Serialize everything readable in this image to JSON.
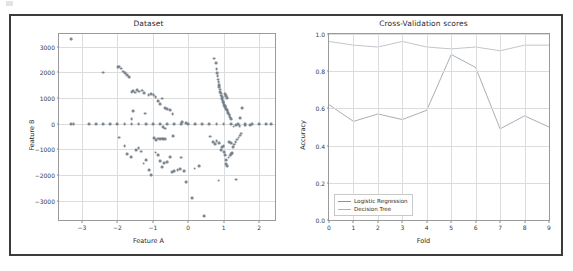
{
  "figure": {
    "background": "#ffffff",
    "border_color": "#3b3b3b"
  },
  "chart_data": [
    {
      "type": "scatter",
      "panel": "left",
      "title": "Dataset",
      "xlabel": "Feature A",
      "ylabel": "Feature B",
      "xlim": [
        -3.65,
        2.45
      ],
      "ylim": [
        -3750,
        3500
      ],
      "xticks": [
        -3,
        -2,
        -1,
        0,
        1,
        2
      ],
      "xticklabels": [
        "−3",
        "−2",
        "−1",
        "0",
        "1",
        "2"
      ],
      "yticks": [
        3000,
        2000,
        1000,
        0,
        -1000,
        -2000,
        -3000
      ],
      "yticklabels": [
        "3000",
        "2000",
        "1000",
        "0",
        "−1000",
        "−2000",
        "−3000"
      ],
      "grid": true,
      "marker_color": "#6f7b85",
      "points": [
        [
          -3.31,
          3290
        ],
        [
          -2.4,
          1995
        ],
        [
          -1.99,
          2215
        ],
        [
          -1.95,
          2230
        ],
        [
          -1.9,
          2150
        ],
        [
          -1.84,
          2035
        ],
        [
          -1.79,
          1985
        ],
        [
          -1.72,
          1890
        ],
        [
          -1.66,
          1820
        ],
        [
          -1.6,
          1245
        ],
        [
          -1.56,
          1280
        ],
        [
          -1.5,
          1215
        ],
        [
          -1.44,
          1300
        ],
        [
          -1.38,
          1255
        ],
        [
          -1.31,
          1290
        ],
        [
          -1.24,
          1195
        ],
        [
          -1.12,
          1110
        ],
        [
          -1.05,
          1165
        ],
        [
          -0.98,
          1120
        ],
        [
          -0.92,
          1055
        ],
        [
          -0.86,
          900
        ],
        [
          -0.8,
          770
        ],
        [
          -0.74,
          980
        ],
        [
          -0.66,
          625
        ],
        [
          -0.6,
          585
        ],
        [
          -0.52,
          530
        ],
        [
          -0.44,
          385
        ],
        [
          -1.55,
          505
        ],
        [
          -1.22,
          400
        ],
        [
          -1.6,
          180
        ],
        [
          -0.18,
          60
        ],
        [
          -0.06,
          25
        ],
        [
          0.74,
          2540
        ],
        [
          0.78,
          2380
        ],
        [
          0.8,
          2120
        ],
        [
          0.82,
          1980
        ],
        [
          0.83,
          1860
        ],
        [
          0.85,
          1720
        ],
        [
          0.86,
          1640
        ],
        [
          0.87,
          1505
        ],
        [
          0.88,
          1440
        ],
        [
          0.89,
          1330
        ],
        [
          0.9,
          1250
        ],
        [
          0.92,
          1180
        ],
        [
          0.93,
          1100
        ],
        [
          0.95,
          1030
        ],
        [
          0.96,
          960
        ],
        [
          0.97,
          905
        ],
        [
          0.99,
          845
        ],
        [
          1.0,
          800
        ],
        [
          1.01,
          740
        ],
        [
          1.03,
          690
        ],
        [
          1.05,
          640
        ],
        [
          1.07,
          585
        ],
        [
          1.09,
          530
        ],
        [
          1.11,
          470
        ],
        [
          1.13,
          410
        ],
        [
          1.15,
          360
        ],
        [
          1.17,
          300
        ],
        [
          1.19,
          240
        ],
        [
          1.21,
          190
        ],
        [
          1.03,
          1160
        ],
        [
          1.06,
          1080
        ],
        [
          1.1,
          995
        ],
        [
          1.52,
          600
        ],
        [
          1.46,
          215
        ],
        [
          -3.3,
          0
        ],
        [
          -3.24,
          0
        ],
        [
          -2.8,
          0
        ],
        [
          -2.6,
          0
        ],
        [
          -2.4,
          0
        ],
        [
          -2.2,
          0
        ],
        [
          -2.0,
          0
        ],
        [
          -1.8,
          0
        ],
        [
          -1.6,
          0
        ],
        [
          -1.4,
          0
        ],
        [
          -1.2,
          0
        ],
        [
          -1.0,
          0
        ],
        [
          -0.8,
          0
        ],
        [
          -0.6,
          0
        ],
        [
          -0.4,
          0
        ],
        [
          -0.2,
          0
        ],
        [
          0.0,
          0
        ],
        [
          0.2,
          0
        ],
        [
          0.4,
          0
        ],
        [
          0.6,
          0
        ],
        [
          0.8,
          0
        ],
        [
          1.0,
          0
        ],
        [
          1.2,
          0
        ],
        [
          1.4,
          0
        ],
        [
          1.6,
          0
        ],
        [
          1.8,
          0
        ],
        [
          2.0,
          0
        ],
        [
          2.2,
          0
        ],
        [
          2.35,
          0
        ],
        [
          -0.7,
          -120
        ],
        [
          -0.66,
          -190
        ],
        [
          1.28,
          -110
        ],
        [
          1.35,
          -60
        ],
        [
          1.45,
          -95
        ],
        [
          1.6,
          -70
        ],
        [
          1.75,
          -60
        ],
        [
          -1.95,
          -540
        ],
        [
          -1.8,
          -860
        ],
        [
          -1.72,
          -1175
        ],
        [
          -1.62,
          -1300
        ],
        [
          -1.48,
          -1010
        ],
        [
          -1.4,
          -940
        ],
        [
          -1.34,
          -1085
        ],
        [
          -1.26,
          -1550
        ],
        [
          -1.2,
          -1430
        ],
        [
          -1.1,
          -1790
        ],
        [
          -1.04,
          -2010
        ],
        [
          -0.96,
          -560
        ],
        [
          -0.9,
          -640
        ],
        [
          -0.86,
          -580
        ],
        [
          -0.8,
          -600
        ],
        [
          -0.74,
          -575
        ],
        [
          -0.7,
          -610
        ],
        [
          -0.66,
          -595
        ],
        [
          -0.92,
          -1120
        ],
        [
          -0.86,
          -1210
        ],
        [
          -0.8,
          -1460
        ],
        [
          -0.74,
          -1680
        ],
        [
          -0.68,
          -1540
        ],
        [
          -0.6,
          -1500
        ],
        [
          -0.52,
          -1290
        ],
        [
          -0.46,
          -1870
        ],
        [
          -0.4,
          -1830
        ],
        [
          -0.3,
          -1800
        ],
        [
          -0.24,
          -1760
        ],
        [
          -0.12,
          -1830
        ],
        [
          -0.06,
          -2270
        ],
        [
          -0.42,
          -495
        ],
        [
          -0.2,
          -1320
        ],
        [
          0.1,
          -2895
        ],
        [
          0.18,
          -1745
        ],
        [
          0.3,
          -1660
        ],
        [
          0.44,
          -3590
        ],
        [
          0.62,
          -500
        ],
        [
          0.7,
          -700
        ],
        [
          0.76,
          -790
        ],
        [
          0.8,
          -690
        ],
        [
          0.88,
          -760
        ],
        [
          0.92,
          -1010
        ],
        [
          0.96,
          -920
        ],
        [
          1.0,
          -860
        ],
        [
          1.02,
          -1090
        ],
        [
          1.04,
          -1235
        ],
        [
          1.06,
          -1400
        ],
        [
          1.08,
          -1560
        ],
        [
          1.1,
          -1640
        ],
        [
          1.14,
          -1320
        ],
        [
          1.18,
          -1240
        ],
        [
          1.22,
          -1195
        ],
        [
          1.26,
          -900
        ],
        [
          1.3,
          -810
        ],
        [
          1.34,
          -700
        ],
        [
          1.38,
          -620
        ],
        [
          1.42,
          -540
        ],
        [
          1.46,
          -460
        ],
        [
          1.5,
          -380
        ],
        [
          1.16,
          -700
        ],
        [
          1.2,
          -760
        ],
        [
          1.24,
          -1150
        ],
        [
          0.86,
          -2215
        ],
        [
          1.36,
          -2175
        ]
      ]
    },
    {
      "type": "line",
      "panel": "right",
      "title": "Cross-Validation scores",
      "xlabel": "Fold",
      "ylabel": "Accuracy",
      "xlim": [
        0,
        9
      ],
      "ylim": [
        0.0,
        1.0
      ],
      "xticks": [
        0,
        1,
        2,
        3,
        4,
        5,
        6,
        7,
        8,
        9
      ],
      "xticklabels": [
        "0",
        "1",
        "2",
        "3",
        "4",
        "5",
        "6",
        "7",
        "8",
        "9"
      ],
      "yticks": [
        0.0,
        0.2,
        0.4,
        0.6,
        0.8,
        1.0
      ],
      "yticklabels": [
        "0.0",
        "0.2",
        "0.4",
        "0.6",
        "0.8",
        "1.0"
      ],
      "grid": true,
      "legend_position": "lower left",
      "x": [
        0,
        1,
        2,
        3,
        4,
        5,
        6,
        7,
        8,
        9
      ],
      "series": [
        {
          "name": "Logistic Regression",
          "color": "#8b93a0",
          "values": [
            0.62,
            0.53,
            0.57,
            0.54,
            0.59,
            0.89,
            0.82,
            0.49,
            0.56,
            0.5
          ]
        },
        {
          "name": "Decision Tree",
          "color": "#aab3bd",
          "values": [
            0.96,
            0.94,
            0.93,
            0.96,
            0.93,
            0.92,
            0.93,
            0.91,
            0.94,
            0.94
          ]
        }
      ]
    }
  ]
}
